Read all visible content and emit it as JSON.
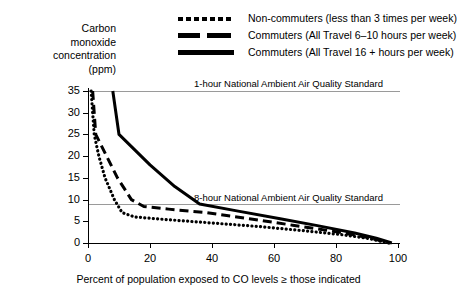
{
  "chart_data": {
    "type": "line",
    "title": "",
    "xlabel": "Percent of population exposed to CO levels ≥ those indicated",
    "ylabel": "Carbon monoxide concentration (ppm)",
    "ylabel_lines": [
      "Carbon",
      "monoxide",
      "concentration",
      "(ppm)"
    ],
    "xlim": [
      0,
      100
    ],
    "ylim": [
      0,
      35
    ],
    "xticks": [
      0,
      20,
      40,
      60,
      80,
      100
    ],
    "yticks": [
      0,
      5,
      10,
      15,
      20,
      25,
      30,
      35
    ],
    "xtick_labels": [
      "0",
      "20",
      "40",
      "60",
      "80",
      "100"
    ],
    "ytick_labels": [
      "0",
      "5",
      "10",
      "15",
      "20",
      "25",
      "30",
      "35"
    ],
    "grid": false,
    "legend_position": "top-right",
    "reference_lines": [
      {
        "name": "one-hour-standard",
        "label": "1-hour National Ambient Air Quality Standard",
        "value": 35,
        "color": "#9a9a9a"
      },
      {
        "name": "eight-hour-standard",
        "label": "8-hour National Ambient Air Quality Standard",
        "value": 9,
        "color": "#9a9a9a"
      }
    ],
    "series": [
      {
        "name": "Non-commuters (less than 3 times per week)",
        "style": "dotted",
        "color": "#000000",
        "points": [
          [
            1.0,
            35.0
          ],
          [
            1.5,
            30.0
          ],
          [
            2.0,
            25.0
          ],
          [
            3.5,
            20.0
          ],
          [
            5.5,
            15.0
          ],
          [
            8.5,
            10.0
          ],
          [
            11.0,
            7.0
          ],
          [
            15.0,
            6.0
          ],
          [
            25.0,
            5.4
          ],
          [
            40.0,
            4.6
          ],
          [
            55.0,
            3.8
          ],
          [
            70.0,
            2.8
          ],
          [
            82.0,
            1.9
          ],
          [
            90.0,
            1.1
          ],
          [
            97.0,
            0.0
          ]
        ]
      },
      {
        "name": "Commuters (All Travel 6–10 hours per week)",
        "style": "dashed",
        "color": "#000000",
        "points": [
          [
            1.5,
            35.0
          ],
          [
            2.0,
            30.0
          ],
          [
            2.5,
            25.0
          ],
          [
            6.0,
            20.0
          ],
          [
            9.5,
            15.0
          ],
          [
            14.0,
            10.0
          ],
          [
            18.0,
            8.4
          ],
          [
            26.0,
            7.8
          ],
          [
            38.0,
            7.0
          ],
          [
            52.0,
            5.6
          ],
          [
            66.0,
            4.1
          ],
          [
            80.0,
            2.6
          ],
          [
            90.0,
            1.3
          ],
          [
            97.5,
            0.0
          ]
        ]
      },
      {
        "name": "Commuters (All Travel 16 +  hours per week)",
        "style": "solid",
        "color": "#000000",
        "points": [
          [
            8.0,
            35.0
          ],
          [
            10.0,
            25.0
          ],
          [
            20.0,
            18.0
          ],
          [
            28.0,
            13.0
          ],
          [
            36.0,
            9.0
          ],
          [
            48.0,
            7.4
          ],
          [
            62.0,
            5.6
          ],
          [
            74.0,
            4.0
          ],
          [
            86.0,
            2.3
          ],
          [
            93.0,
            1.1
          ],
          [
            98.0,
            0.0
          ]
        ]
      }
    ]
  },
  "legend": {
    "items": [
      {
        "label": "Non-commuters (less than 3 times per week)",
        "style": "dotted"
      },
      {
        "label": "Commuters (All Travel 6–10 hours per week)",
        "style": "dashed"
      },
      {
        "label": "Commuters (All Travel 16 +  hours per week)",
        "style": "solid"
      }
    ]
  }
}
